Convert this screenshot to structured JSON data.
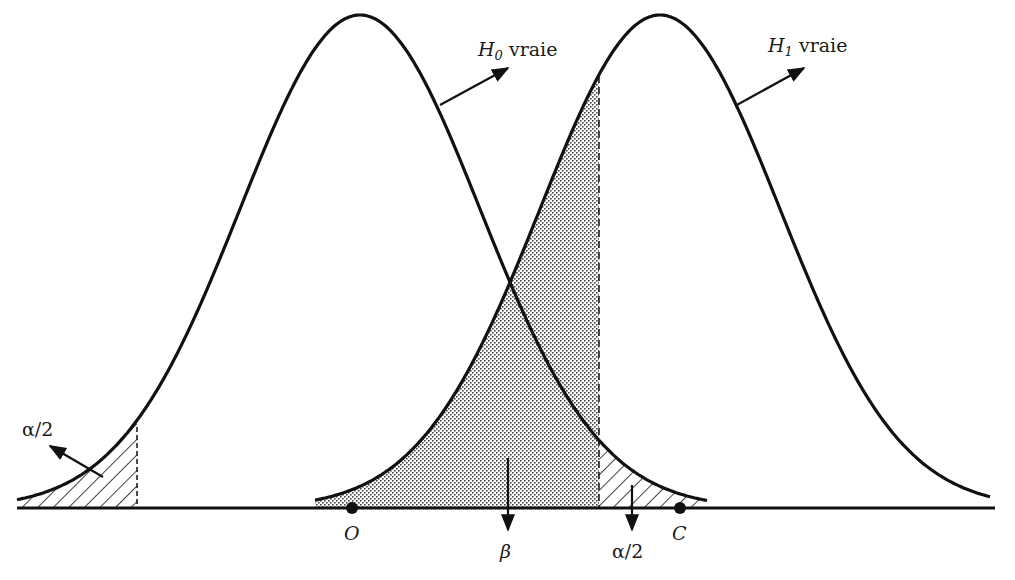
{
  "chart_data": {
    "type": "diagram",
    "title": "",
    "curves": [
      {
        "name": "H0",
        "label_main": "H",
        "label_sub": "0",
        "label_text": "vraie",
        "center_label": "O",
        "peak_x_px": 360
      },
      {
        "name": "H1",
        "label_main": "H",
        "label_sub": "1",
        "label_text": "vraie",
        "center_label": "C",
        "peak_x_px": 660
      }
    ],
    "regions": [
      {
        "name": "alpha/2 left tail",
        "label": "α/2",
        "fill": "hatched",
        "under": "H0",
        "x_range_px": [
          17,
          137
        ]
      },
      {
        "name": "beta",
        "label": "β",
        "fill": "stippled",
        "under": "H1",
        "x_range_px": [
          315,
          599
        ]
      },
      {
        "name": "alpha/2 right tail",
        "label": "α/2",
        "fill": "hatched",
        "under": "H0",
        "x_range_px": [
          599,
          707
        ]
      }
    ],
    "points": [
      {
        "label": "O",
        "x_px": 352
      },
      {
        "label": "C",
        "x_px": 680
      }
    ],
    "critical_lines_px": [
      137,
      599
    ],
    "axis": {
      "xlabel": "",
      "ylabel": "",
      "ticks": "none",
      "grid": false
    },
    "legend": "none"
  },
  "labels": {
    "h0": {
      "main": "H",
      "sub": "0",
      "text": "vraie"
    },
    "h1": {
      "main": "H",
      "sub": "1",
      "text": "vraie"
    },
    "alpha_left": "α/2",
    "alpha_right": "α/2",
    "beta": "β",
    "point_o": "O",
    "point_c": "C"
  },
  "colors": {
    "ink": "#111111",
    "background": "#ffffff",
    "stipple": "#555555"
  }
}
